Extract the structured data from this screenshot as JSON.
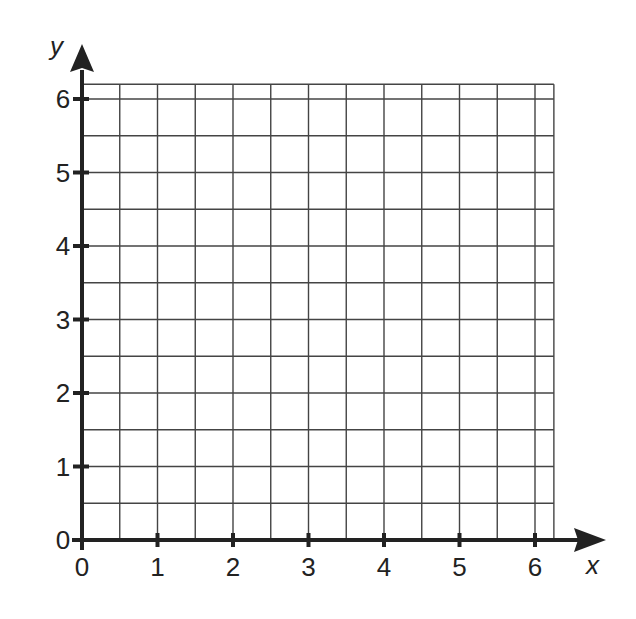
{
  "chart_data": {
    "type": "scatter",
    "title": "",
    "xlabel": "x",
    "ylabel": "y",
    "xlim": [
      0,
      6.25
    ],
    "ylim": [
      0,
      6.2
    ],
    "x_ticks": [
      0,
      1,
      2,
      3,
      4,
      5,
      6
    ],
    "y_ticks": [
      0,
      1,
      2,
      3,
      4,
      5,
      6
    ],
    "x_tick_labels": [
      "0",
      "1",
      "2",
      "3",
      "4",
      "5",
      "6"
    ],
    "y_tick_labels": [
      "0",
      "1",
      "2",
      "3",
      "4",
      "5",
      "6"
    ],
    "grid": true,
    "grid_step": 0.5,
    "series": [],
    "legend": null
  },
  "colors": {
    "axis": "#222222",
    "grid": "#444444",
    "background": "#ffffff"
  }
}
